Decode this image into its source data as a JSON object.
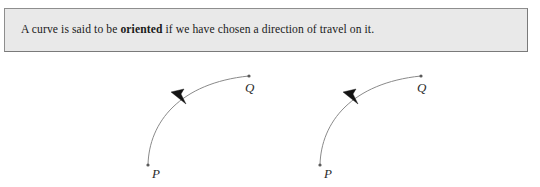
{
  "definition": {
    "text_before": "A curve is said to be ",
    "term": "oriented",
    "text_after": " if we have chosen a direction of travel on it.",
    "background_color": "#e9e9e9",
    "border_color": "#8e8e8e"
  },
  "figures": [
    {
      "name": "oriented-curve-figure-1",
      "start_label": "P",
      "end_label": "Q",
      "curve_color": "#8a8a8a",
      "arrow_color": "#141414",
      "arrow_direction": "up-left",
      "arrow_position_fraction": 0.42
    },
    {
      "name": "oriented-curve-figure-2",
      "start_label": "P",
      "end_label": "Q",
      "curve_color": "#8a8a8a",
      "arrow_color": "#141414",
      "arrow_direction": "up-left",
      "arrow_position_fraction": 0.42
    }
  ]
}
